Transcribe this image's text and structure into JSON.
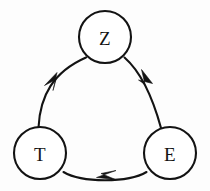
{
  "diagram": {
    "type": "directed-cycle-graph",
    "title": "",
    "background_color": "#fdfdfd",
    "stroke_color": "#131313",
    "node_fill_color": "#ffffff",
    "node_radius": 26,
    "nodes": [
      {
        "id": "Z",
        "label": "Z",
        "cx": 105,
        "cy": 37
      },
      {
        "id": "T",
        "label": "T",
        "cx": 40,
        "cy": 153
      },
      {
        "id": "E",
        "label": "E",
        "cx": 170,
        "cy": 153
      }
    ],
    "edges": [
      {
        "id": "z-to-e",
        "from": "Z",
        "to": "E",
        "label": "",
        "directed": true,
        "path": "M 124.5 57.5 C 141 72 152 95 161 128",
        "arrow": "M 152.5 83.5 L 141.5 69.5 L 145.0 84.5 L 138.5 80.0 Z"
      },
      {
        "id": "e-to-t",
        "from": "E",
        "to": "T",
        "label": "",
        "directed": true,
        "path": "M 146.5 172.0 C 128 183 82 183 63.5 172.0",
        "arrow": "M 96.5 177.5 L 116.0 170.5 L 101.0 173.5 L 115.5 179.5 Z"
      },
      {
        "id": "t-to-z",
        "from": "T",
        "to": "Z",
        "label": "",
        "directed": true,
        "path": "M 38.5 127.5 C 40 96 53 72 86.0 57.5",
        "arrow": "M 57.0 72.5 L 44.5 85.5 L 56.0 79.5 L 53.0 90.5 Z"
      }
    ]
  }
}
